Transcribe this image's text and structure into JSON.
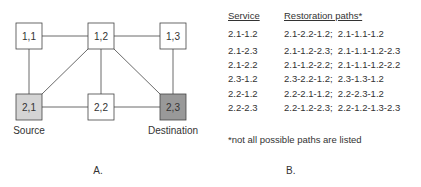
{
  "panelA": {
    "label": "A.",
    "nodes": [
      {
        "id": "1,1",
        "fill": "#ffffff"
      },
      {
        "id": "1,2",
        "fill": "#ffffff"
      },
      {
        "id": "1,3",
        "fill": "#ffffff"
      },
      {
        "id": "2,1",
        "fill": "#d4d4d4"
      },
      {
        "id": "2,2",
        "fill": "#ffffff"
      },
      {
        "id": "2,3",
        "fill": "#999999"
      }
    ],
    "source_label": "Source",
    "destination_label": "Destination"
  },
  "panelB": {
    "label": "B.",
    "header_service": "Service",
    "header_paths": "Restoration paths*",
    "rows": [
      {
        "service": "2.1-1.2",
        "paths": "2.1-2.2-1.2;  2.1-1.1-1.2"
      },
      {
        "service": "2.1-2.3",
        "paths": "2.1-1.2-2.3;  2.1-1.1-1.2-2.3"
      },
      {
        "service": "2.1-2.2",
        "paths": "2.1-1.2-2.2;  2.1-1.1-1.2-2.2"
      },
      {
        "service": "2.3-1.2",
        "paths": "2.3-2.2-1.2;  2.3-1.3-1.2"
      },
      {
        "service": "2.2-1.2",
        "paths": "2.2-2.1-1.2;  2.2-2.3-1.2"
      },
      {
        "service": "2.2-2.3",
        "paths": "2.2-1.2-2.3;  2.2-1.2-1.3-2.3"
      }
    ],
    "footnote": "*not all possible paths are listed"
  }
}
